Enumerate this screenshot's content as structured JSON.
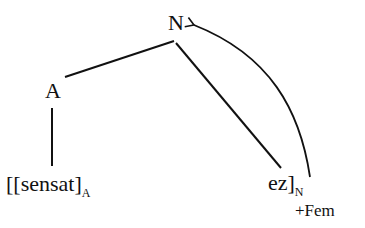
{
  "diagram": {
    "type": "morphological-tree",
    "nodes": {
      "root": {
        "label": "N"
      },
      "left_child": {
        "label": "A"
      },
      "stem": {
        "bracket_open": "[[",
        "text": "sensat",
        "bracket_close": "]",
        "subscript": "A"
      },
      "suffix": {
        "text": "ez",
        "bracket_close": "]",
        "subscript": "N",
        "feature": "+Fem"
      }
    },
    "edges": [
      {
        "from": "N",
        "to": "A",
        "kind": "branch"
      },
      {
        "from": "N",
        "to": "ez",
        "kind": "branch"
      },
      {
        "from": "A",
        "to": "sensat",
        "kind": "branch"
      },
      {
        "from": "ez",
        "to": "N",
        "kind": "feature-percolation-arrow"
      }
    ]
  }
}
